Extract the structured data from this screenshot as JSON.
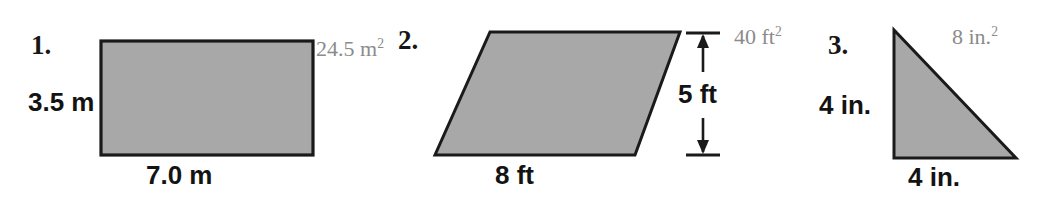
{
  "page": {
    "width": 1043,
    "height": 198,
    "background": "#ffffff",
    "shape_fill": "#a8a8a8",
    "shape_stroke": "#1a1a1a",
    "answer_color": "#8b8b8b",
    "label_color": "#131313"
  },
  "problems": [
    {
      "index": "1.",
      "shape": "rectangle",
      "height_label": "3.5 m",
      "base_label": "7.0 m",
      "area_value": "24.5 m",
      "area_exponent": "2",
      "area_full": "24.5 m²"
    },
    {
      "index": "2.",
      "shape": "parallelogram",
      "height_label": "5 ft",
      "base_label": "8 ft",
      "area_value": "40 ft",
      "area_exponent": "2",
      "area_full": "40 ft²"
    },
    {
      "index": "3.",
      "shape": "right-triangle",
      "height_label": "4 in.",
      "base_label": "4 in.",
      "area_value": "8 in.",
      "area_exponent": "2",
      "area_full": "8 in.²"
    }
  ]
}
